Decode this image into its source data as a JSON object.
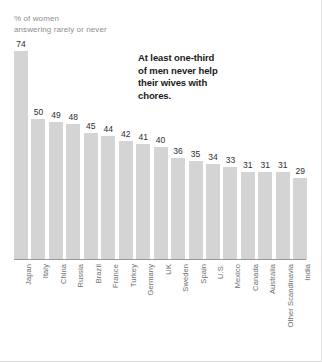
{
  "chart_data": {
    "type": "bar",
    "title": "",
    "subtitle": "% of women\nanswering rarely or never",
    "xlabel": "",
    "ylabel": "",
    "ylim": [
      0,
      80
    ],
    "grid": false,
    "legend": "none",
    "annotations": [
      {
        "text": "At least one-third of men never help their wives with chores.",
        "bold": true
      }
    ],
    "categories": [
      "Japan",
      "Italy",
      "China",
      "Russia",
      "Brazil",
      "France",
      "Turkey",
      "Germany",
      "UK",
      "Sweden",
      "Spain",
      "U.S.",
      "Mexico",
      "Canada",
      "Australia",
      "Other Scandinavia",
      "India"
    ],
    "values": [
      74,
      50,
      49,
      48,
      45,
      44,
      42,
      41,
      40,
      36,
      35,
      34,
      33,
      31,
      31,
      31,
      29
    ],
    "bar_color": "#d4d4d4",
    "axis_color": "#9a9a9a"
  }
}
